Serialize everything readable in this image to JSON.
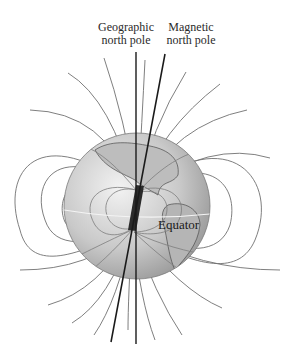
{
  "diagram": {
    "labels": {
      "geographic_pole": [
        "Geographic",
        "north pole"
      ],
      "magnetic_pole": [
        "Magnetic",
        "north pole"
      ],
      "equator": "Equator"
    },
    "colors": {
      "globe_light": "#e6e6e6",
      "globe_dark": "#8e8e8e",
      "field_line": "#6a6a6a",
      "axis": "#1a1a1a",
      "magnet": "#2b2b2b",
      "equator_line": "#f4f4f4",
      "text": "#2a2a2a"
    }
  }
}
